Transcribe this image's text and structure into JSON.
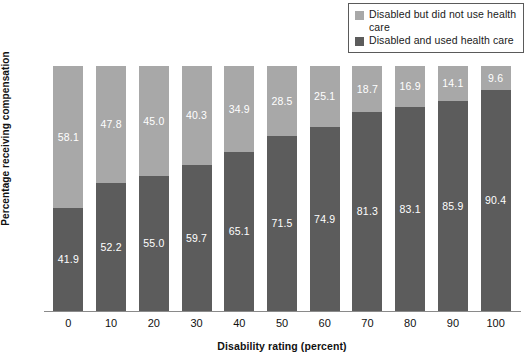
{
  "chart_data": {
    "type": "bar",
    "subtype": "stacked-100-percent",
    "title": "",
    "xlabel": "Disability rating (percent)",
    "ylabel": "Percentage receiving compensation",
    "categories": [
      "0",
      "10",
      "20",
      "30",
      "40",
      "50",
      "60",
      "70",
      "80",
      "90",
      "100"
    ],
    "series": [
      {
        "name": "Disabled and used health care",
        "color": "#5c5c5c",
        "stack_position": "bottom",
        "values": [
          41.9,
          52.2,
          55.0,
          59.7,
          65.1,
          71.5,
          74.9,
          81.3,
          83.1,
          85.9,
          90.4
        ],
        "labels": [
          "41.9",
          "52.2",
          "55.0",
          "59.7",
          "65.1",
          "71.5",
          "74.9",
          "81.3",
          "83.1",
          "85.9",
          "90.4"
        ]
      },
      {
        "name": "Disabled but did not use health care",
        "color": "#a8a8a8",
        "stack_position": "top",
        "values": [
          58.1,
          47.8,
          45.0,
          40.3,
          34.9,
          28.5,
          25.1,
          18.7,
          16.9,
          14.1,
          9.6
        ],
        "labels": [
          "58.1",
          "47.8",
          "45.0",
          "40.3",
          "34.9",
          "28.5",
          "25.1",
          "18.7",
          "16.9",
          "14.1",
          "9.6"
        ]
      }
    ],
    "ylim": [
      0,
      100
    ],
    "grid": false,
    "legend_position": "top-right",
    "label_text_color": "#ffffff"
  },
  "legend": {
    "items": [
      {
        "label": "Disabled but did not use health care",
        "color": "#a8a8a8"
      },
      {
        "label": "Disabled and used health care",
        "color": "#5c5c5c"
      }
    ]
  },
  "axes": {
    "x_title": "Disability rating (percent)",
    "y_title": "Percentage receiving compensation",
    "x_ticks": [
      "0",
      "10",
      "20",
      "30",
      "40",
      "50",
      "60",
      "70",
      "80",
      "90",
      "100"
    ]
  }
}
